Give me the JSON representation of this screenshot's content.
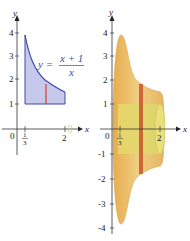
{
  "left_panel": {
    "axes": {
      "x_label": "x",
      "y_label": "y",
      "origin_label": "0",
      "x_ticks": [
        {
          "num": "1",
          "den": "3"
        },
        {
          "label": "2"
        }
      ],
      "y_ticks": [
        "1",
        "2",
        "3",
        "4"
      ]
    },
    "equation": {
      "lhs": "y =",
      "numerator": "x + 1",
      "denominator": "x"
    },
    "colors": {
      "region_fill": "#c6c9ec",
      "curve": "#3b4ba8",
      "slice": "#d9463a"
    }
  },
  "right_panel": {
    "axes": {
      "x_label": "x",
      "y_label": "y",
      "origin_label": "0",
      "x_ticks": [
        {
          "num": "1",
          "den": "3"
        },
        {
          "label": "2"
        }
      ],
      "y_ticks": [
        "4",
        "3",
        "2",
        "1",
        "-1",
        "-2",
        "-3",
        "-4"
      ]
    },
    "colors": {
      "solid_outer": "#e9b85a",
      "solid_inner": "#dfe07a",
      "slice": "#c8542e"
    }
  }
}
